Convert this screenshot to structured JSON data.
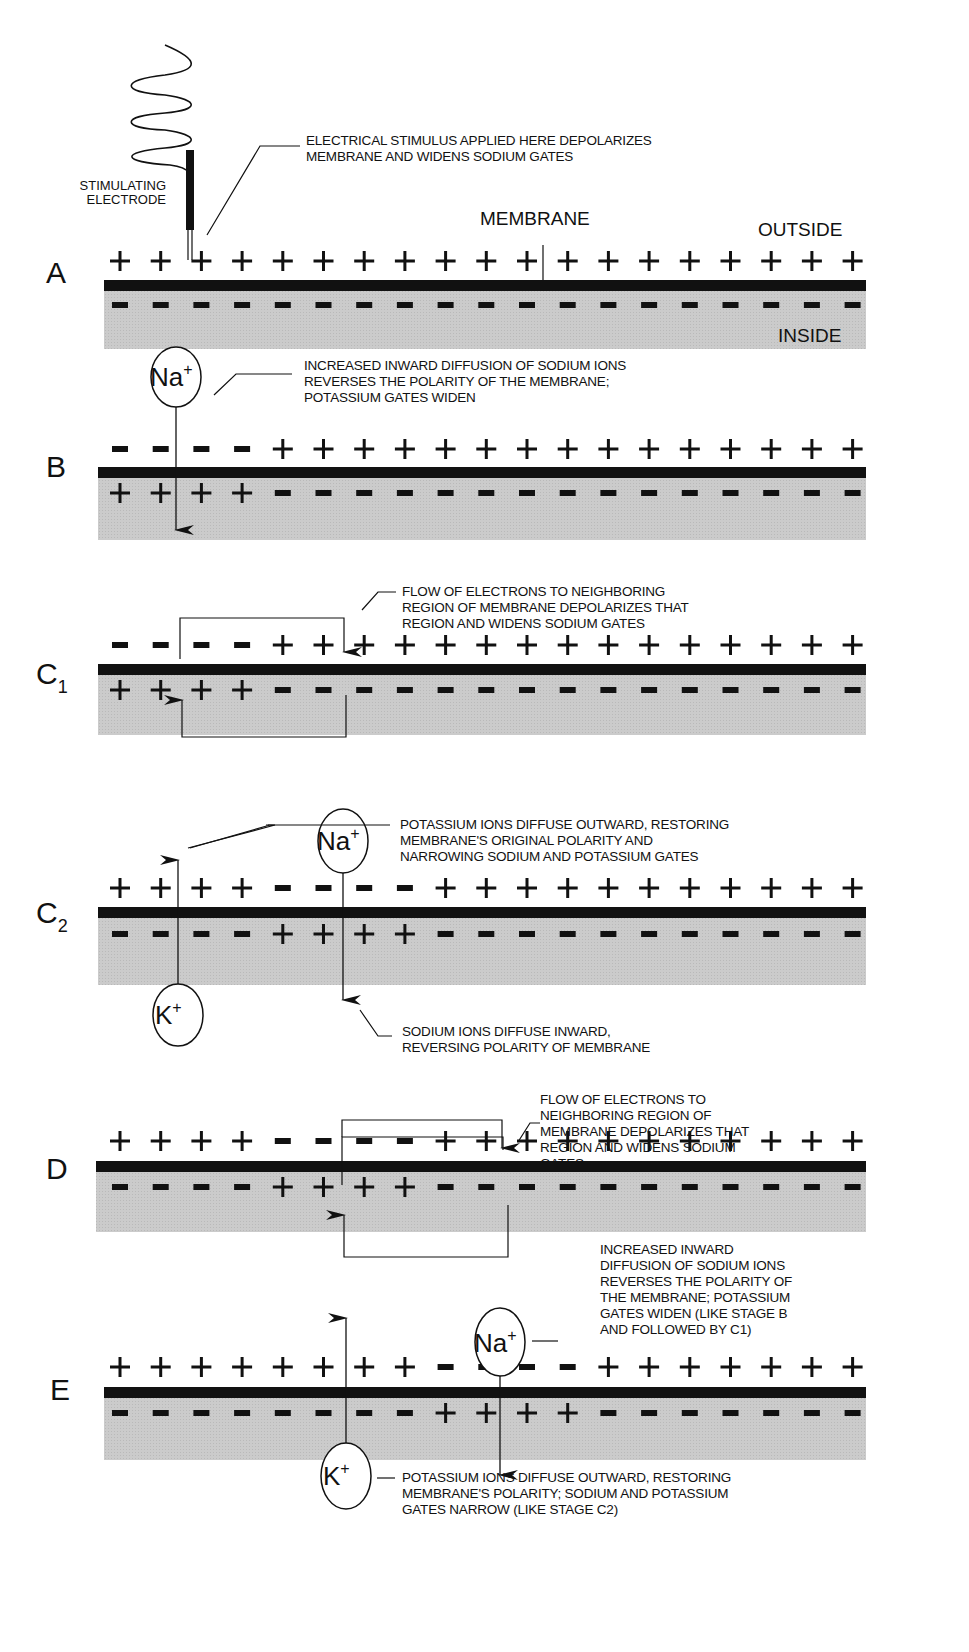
{
  "figure": {
    "colors": {
      "membrane": "#111111",
      "inside_fill": "#c8c8c8",
      "ink": "#111111",
      "background": "#ffffff"
    },
    "electrode": {
      "label_line1": "STIMULATING",
      "label_line2": "ELECTRODE",
      "note_line1": "ELECTRICAL STIMULUS APPLIED HERE DEPOLARIZES",
      "note_line2": "MEMBRANE AND WIDENS SODIUM GATES"
    },
    "region_labels": {
      "membrane": "MEMBRANE",
      "outside": "OUTSIDE",
      "inside": "INSIDE"
    },
    "ions": {
      "sodium": "Na",
      "potassium": "K",
      "charge": "+"
    },
    "stages": [
      {
        "id": "A",
        "letter": "A",
        "subscript": "",
        "outside_charges": "+ + + + + + + + + + + + + + + + + + +",
        "inside_charges": "- - - - - - - - - - - - - - - - - - -",
        "notes": []
      },
      {
        "id": "B",
        "letter": "B",
        "subscript": "",
        "outside_charges": "- - - - + + + + + + + + + + + + + + +",
        "inside_charges": "+ + + + - - - - - - - - - - - - - - -",
        "notes": [
          "INCREASED INWARD DIFFUSION OF SODIUM IONS",
          "REVERSES THE POLARITY OF THE MEMBRANE;",
          "POTASSIUM GATES WIDEN"
        ]
      },
      {
        "id": "C1",
        "letter": "C",
        "subscript": "1",
        "outside_charges": "- - - - + + + + + + + + + + + + + + +",
        "inside_charges": "+ + + + - - - - - - - - - - - - - - -",
        "notes": [
          "FLOW OF ELECTRONS TO NEIGHBORING",
          "REGION OF MEMBRANE DEPOLARIZES THAT",
          "REGION AND WIDENS SODIUM GATES"
        ]
      },
      {
        "id": "C2",
        "letter": "C",
        "subscript": "2",
        "outside_charges": "+ + + + - - - - + + + + + + + + + + +",
        "inside_charges": "- - - - + + + + - - - - - - - - - - -",
        "notes": [
          "POTASSIUM IONS DIFFUSE OUTWARD, RESTORING",
          "MEMBRANE'S ORIGINAL POLARITY AND",
          "NARROWING SODIUM AND POTASSIUM GATES"
        ],
        "notes_lower": [
          "SODIUM IONS DIFFUSE INWARD,",
          "REVERSING POLARITY OF MEMBRANE"
        ]
      },
      {
        "id": "D",
        "letter": "D",
        "subscript": "",
        "outside_charges": "+ + + + - - - - + + + + + + + + + + +",
        "inside_charges": "- - - - + + + + - - - - - - - - - - -",
        "notes": [
          "FLOW OF ELECTRONS TO",
          "NEIGHBORING REGION OF",
          "MEMBRANE DEPOLARIZES THAT",
          "REGION AND WIDENS SODIUM",
          "GATES"
        ]
      },
      {
        "id": "E",
        "letter": "E",
        "subscript": "",
        "outside_charges": "+ + + + + + + + - - - - + + + + + + +",
        "inside_charges": "- - - - - - - - + + + + - - - - - - -",
        "notes": [
          "INCREASED INWARD",
          "DIFFUSION OF SODIUM IONS",
          "REVERSES THE POLARITY OF",
          "THE MEMBRANE; POTASSIUM",
          "GATES WIDEN (LIKE STAGE B",
          "AND FOLLOWED BY C1)"
        ],
        "notes_lower": [
          "POTASSIUM IONS DIFFUSE OUTWARD, RESTORING",
          "MEMBRANE'S POLARITY; SODIUM AND POTASSIUM",
          "GATES NARROW (LIKE STAGE C2)"
        ]
      }
    ]
  }
}
